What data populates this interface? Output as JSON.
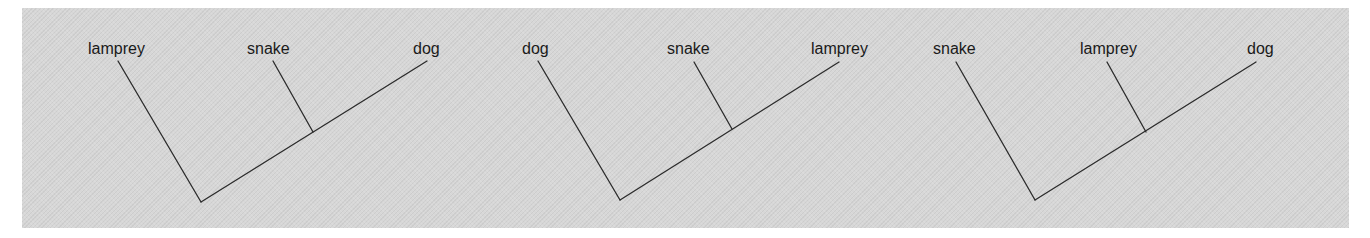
{
  "figure": {
    "colors": {
      "background": "#d7d7d7",
      "line": "#2b2b2b",
      "text": "#1a1a1a"
    }
  },
  "trees": [
    {
      "labels": [
        "lamprey",
        "snake",
        "dog"
      ],
      "outgroup": "lamprey",
      "sister_pair": [
        "snake",
        "dog"
      ]
    },
    {
      "labels": [
        "dog",
        "snake",
        "lamprey"
      ],
      "outgroup": "dog",
      "sister_pair": [
        "snake",
        "lamprey"
      ]
    },
    {
      "labels": [
        "snake",
        "lamprey",
        "dog"
      ],
      "outgroup": "snake",
      "sister_pair": [
        "lamprey",
        "dog"
      ]
    }
  ]
}
